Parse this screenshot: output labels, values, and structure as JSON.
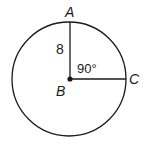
{
  "diagram": {
    "type": "circle-geometry",
    "center_point": {
      "label": "B"
    },
    "points": [
      {
        "label": "A",
        "position": "top of circle"
      },
      {
        "label": "C",
        "position": "right of circle"
      }
    ],
    "radius_label": "8",
    "angle_label": "90°",
    "colors": {
      "stroke": "#1a1a1a",
      "background": "#ffffff"
    }
  }
}
